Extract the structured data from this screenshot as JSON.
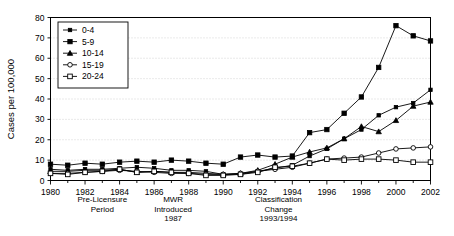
{
  "chart_data": {
    "type": "line",
    "title": "",
    "xlabel": "",
    "ylabel": "Cases per 100,000",
    "xlim": [
      1980,
      2002
    ],
    "ylim": [
      0,
      80
    ],
    "yticks": [
      0,
      10,
      20,
      30,
      40,
      50,
      60,
      70,
      80
    ],
    "xticks": [
      1980,
      1982,
      1984,
      1986,
      1988,
      1990,
      1992,
      1994,
      1996,
      1998,
      2000,
      2002
    ],
    "xtick_labels": [
      "1980",
      "1982",
      "1984",
      "1986",
      "1988",
      "1990",
      "1992",
      "1994",
      "1996",
      "1998",
      "2000",
      "2002"
    ],
    "ytick_labels": [
      "0",
      "10",
      "20",
      "30",
      "40",
      "50",
      "60",
      "70",
      "80"
    ],
    "grid": true,
    "legend_position": "upper-left",
    "x": [
      1980,
      1981,
      1982,
      1983,
      1984,
      1985,
      1986,
      1987,
      1988,
      1989,
      1990,
      1991,
      1992,
      1993,
      1994,
      1995,
      1996,
      1997,
      1998,
      1999,
      2000,
      2001,
      2002
    ],
    "series": [
      {
        "name": "0-4",
        "marker": "small-filled-square",
        "values": [
          5.5,
          5.0,
          5.5,
          5.5,
          6.0,
          6.5,
          6.0,
          5.0,
          5.0,
          4.5,
          3.0,
          3.0,
          4.5,
          6.0,
          7.5,
          12.0,
          15.5,
          20.5,
          25.0,
          32.0,
          36.0,
          38.0,
          44.5
        ]
      },
      {
        "name": "5-9",
        "marker": "filled-square",
        "values": [
          8.0,
          7.5,
          8.5,
          8.0,
          9.0,
          9.5,
          9.0,
          10.0,
          9.5,
          8.5,
          8.0,
          11.5,
          12.5,
          11.5,
          12.0,
          23.5,
          25.0,
          33.0,
          41.0,
          55.5,
          76.0,
          71.0,
          68.5
        ]
      },
      {
        "name": "10-14",
        "marker": "filled-triangle",
        "values": [
          4.5,
          4.5,
          5.0,
          5.0,
          5.5,
          4.0,
          4.5,
          4.0,
          4.0,
          3.5,
          3.0,
          3.5,
          5.0,
          8.0,
          11.5,
          14.0,
          16.0,
          20.5,
          26.5,
          24.0,
          29.5,
          36.5,
          38.5
        ]
      },
      {
        "name": "15-19",
        "marker": "open-circle",
        "values": [
          3.5,
          3.5,
          4.0,
          4.5,
          5.0,
          4.5,
          4.0,
          3.5,
          3.5,
          3.0,
          3.0,
          3.5,
          4.5,
          5.5,
          6.5,
          8.5,
          10.5,
          11.0,
          11.5,
          13.5,
          15.5,
          16.0,
          16.5
        ]
      },
      {
        "name": "20-24",
        "marker": "open-square",
        "values": [
          3.5,
          3.0,
          4.0,
          4.5,
          5.5,
          4.0,
          4.5,
          4.0,
          3.5,
          2.5,
          2.5,
          3.0,
          4.0,
          6.5,
          7.0,
          8.5,
          10.5,
          10.0,
          10.5,
          10.5,
          10.0,
          9.0,
          9.0
        ]
      }
    ],
    "annotations": [
      {
        "id": "pre-licensure",
        "lines": [
          "Pre-Licensure",
          "Period"
        ],
        "x_year": 1983.0
      },
      {
        "id": "mwr-introduced",
        "lines": [
          "MWR",
          "Introduced",
          "1987"
        ],
        "x_year": 1987.1
      },
      {
        "id": "classification-change",
        "lines": [
          "Classification",
          "Change",
          "1993/1994"
        ],
        "x_year": 1993.2
      }
    ]
  },
  "colors": {
    "ink": "#000000",
    "grid": "#b9b9b9",
    "background": "#ffffff"
  }
}
